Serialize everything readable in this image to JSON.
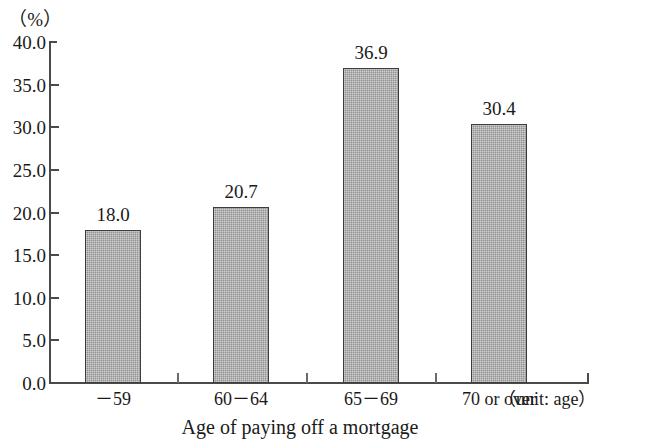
{
  "chart_data": {
    "type": "bar",
    "title": "",
    "categories": [
      "－59",
      "60－64",
      "65－69",
      "70 or over"
    ],
    "values": [
      18.0,
      20.7,
      36.9,
      30.4
    ],
    "value_labels": [
      "18.0",
      "20.7",
      "36.9",
      "30.4"
    ],
    "xlabel": "Age of paying off a mortgage",
    "ylabel": "（%）",
    "x_unit_note": "（unit: age）",
    "ylim": [
      0.0,
      40.0
    ],
    "ytick_step": 5.0,
    "ytick_labels": [
      "40.0",
      "35.0",
      "30.0",
      "25.0",
      "20.0",
      "15.0",
      "10.0",
      "5.0",
      "0.0"
    ],
    "ytick_values": [
      40.0,
      35.0,
      30.0,
      25.0,
      20.0,
      15.0,
      10.0,
      5.0,
      0.0
    ],
    "grid": false,
    "legend": null,
    "bar_fill_color": "#9b9b9b",
    "bar_border_color": "#3d3d3d",
    "axis_color": "#4a4a4a",
    "text_color": "#1a1a1a"
  },
  "axis": {
    "y_unit_caption": "（%）",
    "x_unit_caption": "（unit: age）",
    "x_title": "Age of paying off a mortgage"
  }
}
